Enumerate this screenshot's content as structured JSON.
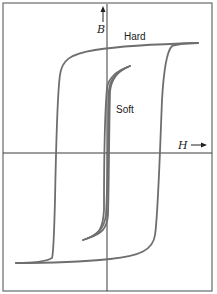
{
  "figure": {
    "axes": {
      "x_label": "H",
      "x_arrow": "→",
      "y_label": "B",
      "y_arrow": "↑"
    },
    "curves": [
      {
        "name": "hard-loop",
        "label": "Hard"
      },
      {
        "name": "soft-loop",
        "label": "Soft"
      }
    ],
    "colors": {
      "curve": "#6e6e6e",
      "axis": "#3a3a3a",
      "frame": "#6a6a6a"
    }
  }
}
